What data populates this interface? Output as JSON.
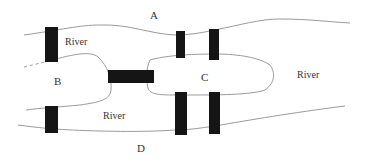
{
  "diagram": {
    "regions": [
      {
        "id": "A",
        "label": "A"
      },
      {
        "id": "B",
        "label": "B"
      },
      {
        "id": "C",
        "label": "C"
      },
      {
        "id": "D",
        "label": "D"
      }
    ],
    "river_labels": [
      {
        "label": "River"
      },
      {
        "label": "River"
      },
      {
        "label": "River"
      }
    ],
    "bridge_count": 7,
    "colors": {
      "bridge": "#151515",
      "shoreline": "#9a9a9a",
      "text": "#333333",
      "background": "#ffffff"
    }
  }
}
